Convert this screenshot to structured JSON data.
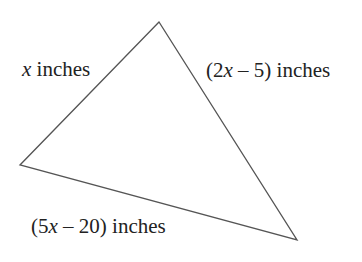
{
  "diagram": {
    "type": "triangle",
    "vertices": {
      "top": [
        159,
        22
      ],
      "left": [
        20,
        165
      ],
      "bottom_right": [
        297,
        240
      ]
    },
    "stroke_color": "#555555",
    "side_labels": {
      "left_side": {
        "variable": "x",
        "text": " inches"
      },
      "right_side": {
        "prefix": "(2",
        "variable": "x",
        "suffix": " – 5) inches"
      },
      "bottom_side": {
        "prefix": "(5",
        "variable": "x",
        "suffix": " – 20) inches"
      }
    }
  }
}
